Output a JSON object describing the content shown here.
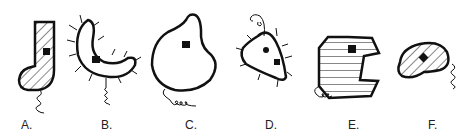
{
  "figure": {
    "organisms": [
      {
        "id": "A",
        "label": "A.",
        "shape": "boot/J-shaped",
        "fill": "diagonal-hatch",
        "features": [
          "square-nucleus",
          "coiled-flagellum"
        ]
      },
      {
        "id": "B",
        "label": "B.",
        "shape": "crescent/banana",
        "fill": "none",
        "features": [
          "square-nucleus",
          "cilia",
          "coiled-flagellum"
        ]
      },
      {
        "id": "C",
        "label": "C.",
        "shape": "kidney/lobed blob",
        "fill": "none",
        "features": [
          "square-nucleus",
          "coiled-flagellum"
        ]
      },
      {
        "id": "D",
        "label": "D.",
        "shape": "heart/triangular",
        "fill": "none",
        "features": [
          "round-body",
          "square-nucleus",
          "cilia",
          "coiled-flagellum"
        ]
      },
      {
        "id": "E",
        "label": "E.",
        "shape": "octagon with notch",
        "fill": "horizontal-stripes",
        "features": [
          "square-nucleus",
          "coiled-flagellum"
        ]
      },
      {
        "id": "F",
        "label": "F.",
        "shape": "bean/oval",
        "fill": "diagonal-hatch",
        "features": [
          "square-nucleus",
          "coiled-flagellum"
        ]
      }
    ],
    "colors": {
      "stroke": "#111111",
      "background": "#ffffff"
    }
  }
}
